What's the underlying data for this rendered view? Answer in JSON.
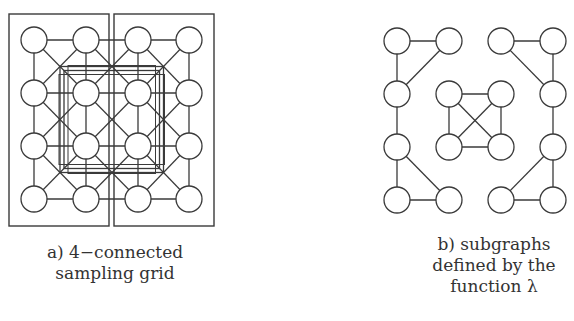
{
  "figure_a": {
    "caption_lines": [
      "a) 4−connected",
      "sampling grid"
    ],
    "grid": {
      "cols_x": [
        34,
        86,
        138,
        189
      ],
      "rows_y": [
        40,
        93,
        146,
        199
      ],
      "node_radius": 13
    },
    "boxes": [
      {
        "x": 9,
        "y": 14,
        "w": 100,
        "h": 212
      },
      {
        "x": 114,
        "y": 14,
        "w": 100,
        "h": 212
      }
    ]
  },
  "figure_b": {
    "caption_lines": [
      "b) subgraphs",
      "defined by the",
      "function λ"
    ],
    "grid": {
      "cols_x": [
        397,
        449,
        501,
        553
      ],
      "rows_y": [
        41,
        94,
        147,
        200
      ],
      "node_radius": 13
    },
    "edges": [
      [
        [
          0,
          0
        ],
        [
          1,
          0
        ]
      ],
      [
        [
          0,
          0
        ],
        [
          0,
          1
        ]
      ],
      [
        [
          1,
          0
        ],
        [
          0,
          1
        ]
      ],
      [
        [
          0,
          1
        ],
        [
          0,
          2
        ]
      ],
      [
        [
          0,
          2
        ],
        [
          0,
          3
        ]
      ],
      [
        [
          0,
          2
        ],
        [
          1,
          3
        ]
      ],
      [
        [
          0,
          3
        ],
        [
          1,
          3
        ]
      ],
      [
        [
          2,
          0
        ],
        [
          3,
          0
        ]
      ],
      [
        [
          3,
          0
        ],
        [
          3,
          1
        ]
      ],
      [
        [
          2,
          0
        ],
        [
          3,
          1
        ]
      ],
      [
        [
          3,
          1
        ],
        [
          3,
          2
        ]
      ],
      [
        [
          3,
          2
        ],
        [
          3,
          3
        ]
      ],
      [
        [
          3,
          2
        ],
        [
          2,
          3
        ]
      ],
      [
        [
          2,
          3
        ],
        [
          3,
          3
        ]
      ],
      [
        [
          1,
          1
        ],
        [
          2,
          1
        ]
      ],
      [
        [
          1,
          1
        ],
        [
          1,
          2
        ]
      ],
      [
        [
          2,
          1
        ],
        [
          2,
          2
        ]
      ],
      [
        [
          1,
          2
        ],
        [
          2,
          2
        ]
      ],
      [
        [
          1,
          1
        ],
        [
          2,
          2
        ]
      ],
      [
        [
          2,
          1
        ],
        [
          1,
          2
        ]
      ]
    ]
  },
  "colors": {
    "stroke": "#3a3a3a",
    "node_fill": "#ffffff",
    "background": "#ffffff"
  }
}
